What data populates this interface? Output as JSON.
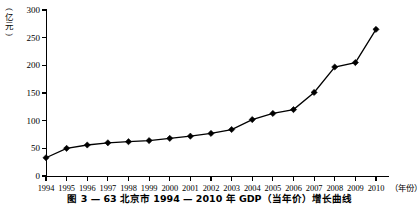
{
  "chart_data": {
    "type": "line",
    "title": "",
    "caption": "图 3 — 63  北京市 1994 — 2010 年 GDP（当年价）增长曲线",
    "xlabel": "（年份）",
    "ylabel": "（亿元）",
    "categories": [
      "1994",
      "1995",
      "1996",
      "1997",
      "1998",
      "1999",
      "2000",
      "2001",
      "2002",
      "2003",
      "2004",
      "2005",
      "2006",
      "2007",
      "2008",
      "2009",
      "2010"
    ],
    "values": [
      33,
      50,
      56,
      60,
      62,
      64,
      68,
      72,
      77,
      84,
      102,
      113,
      120,
      151,
      197,
      205,
      265
    ],
    "ylim": [
      0,
      300
    ],
    "yticks": [
      0,
      50,
      100,
      150,
      200,
      250,
      300
    ],
    "ytick_labels": [
      "0",
      "50",
      "100",
      "150",
      "200",
      "250",
      "300"
    ],
    "grid": false,
    "legend": "none",
    "marker": "diamond",
    "line_color": "#000000",
    "marker_color": "#000000"
  },
  "axes": {
    "y_unit_paren_open": "(",
    "y_unit_char_1": "亿",
    "y_unit_char_2": "元",
    "y_unit_paren_close": ")",
    "x_unit": "（年份）"
  }
}
